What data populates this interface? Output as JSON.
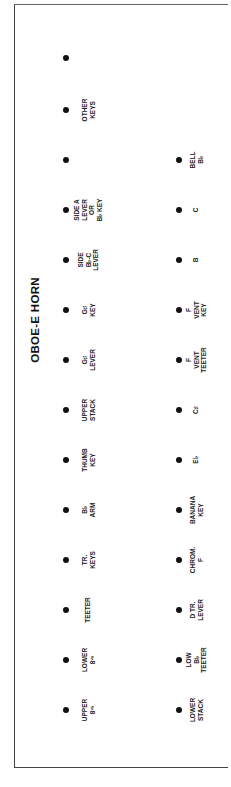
{
  "title": "OBOE-E HORN",
  "left_row": [
    {
      "label": "",
      "y": 58
    },
    {
      "label": "OTHER\nKEYS",
      "y": 110
    },
    {
      "label": "",
      "y": 160
    },
    {
      "label": "SIDE A\nLEVER\nOR\nB♭ KEY",
      "y": 210
    },
    {
      "label": "SIDE\nB♭-C\nLEVER",
      "y": 260
    },
    {
      "label": "G♯\nKEY",
      "y": 310
    },
    {
      "label": "G♯\nLEVER",
      "y": 360
    },
    {
      "label": "UPPER\nSTACK",
      "y": 410
    },
    {
      "label": "THUMB\nKEY",
      "y": 460
    },
    {
      "label": "B♭\nARM",
      "y": 510
    },
    {
      "label": "TR.\nKEYS",
      "y": 560
    },
    {
      "label": "TEETER",
      "y": 610
    },
    {
      "label": "LOWER\n8ᵛᵃ",
      "y": 660
    },
    {
      "label": "UPPER\n8ᵛᵃ",
      "y": 710
    }
  ],
  "right_row": [
    {
      "label": "BELL\nB♭",
      "y": 160
    },
    {
      "label": "C",
      "y": 210
    },
    {
      "label": "B",
      "y": 260
    },
    {
      "label": "F\nVENT\nKEY",
      "y": 310
    },
    {
      "label": "F\nVENT\nTEETER",
      "y": 360
    },
    {
      "label": "C♯",
      "y": 410
    },
    {
      "label": "E♭",
      "y": 460
    },
    {
      "label": "BANANA\nKEY",
      "y": 510
    },
    {
      "label": "CHROM.\nF",
      "y": 560
    },
    {
      "label": "D TR.\nLEVER",
      "y": 610
    },
    {
      "label": "LOW\nB♭\nTEETER",
      "y": 660
    },
    {
      "label": "LOWER\nSTACK",
      "y": 710
    }
  ]
}
